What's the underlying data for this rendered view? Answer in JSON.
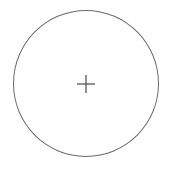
{
  "button": {
    "label": "Add",
    "icon": "plus-icon",
    "border_color": "#6a6a6a",
    "icon_color": "#555555",
    "background": "#ffffff"
  }
}
